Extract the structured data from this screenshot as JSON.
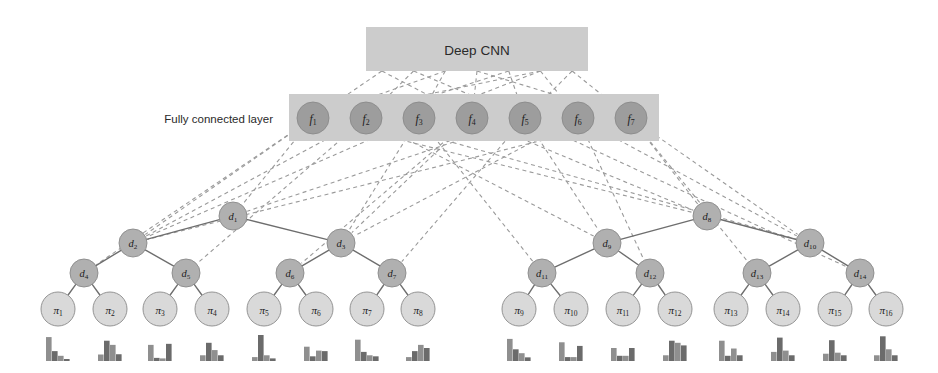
{
  "figure": {
    "type": "diagram",
    "title_box": {
      "label": "Deep CNN"
    },
    "side_label": {
      "label": "Fully connected layer"
    },
    "colors": {
      "box_fill": "#cccccc",
      "fc_node_fill": "#9d9d9d",
      "decision_node_fill": "#b0b0b0",
      "leaf_node_fill": "#d9d9d9",
      "node_stroke": "#8a8a8a",
      "solid_edge": "#6e6e6e",
      "dashed_edge": "#9a9a9a",
      "hist_bar": "#8f8f8f",
      "hist_bar_dark": "#6b6b6b",
      "text": "#1c1c1c",
      "background": "#ffffff"
    },
    "cnn_box": {
      "x": 366,
      "y": 27,
      "w": 222,
      "h": 44
    },
    "fc_box": {
      "x": 289,
      "y": 94,
      "w": 370,
      "h": 47
    },
    "fc_nodes": [
      {
        "id": "f1",
        "base": "f",
        "sub": "1",
        "cx": 313,
        "cy": 118,
        "r": 16
      },
      {
        "id": "f2",
        "base": "f",
        "sub": "2",
        "cx": 366,
        "cy": 118,
        "r": 16
      },
      {
        "id": "f3",
        "base": "f",
        "sub": "3",
        "cx": 419,
        "cy": 118,
        "r": 16
      },
      {
        "id": "f4",
        "base": "f",
        "sub": "4",
        "cx": 472,
        "cy": 118,
        "r": 16
      },
      {
        "id": "f5",
        "base": "f",
        "sub": "5",
        "cx": 525,
        "cy": 118,
        "r": 16
      },
      {
        "id": "f6",
        "base": "f",
        "sub": "6",
        "cx": 578,
        "cy": 118,
        "r": 16
      },
      {
        "id": "f7",
        "base": "f",
        "sub": "7",
        "cx": 631,
        "cy": 118,
        "r": 16
      }
    ],
    "decision_nodes": [
      {
        "id": "d1",
        "base": "d",
        "sub": "1",
        "cx": 233,
        "cy": 216,
        "r": 14
      },
      {
        "id": "d2",
        "base": "d",
        "sub": "2",
        "cx": 133,
        "cy": 243,
        "r": 14
      },
      {
        "id": "d3",
        "base": "d",
        "sub": "3",
        "cx": 341,
        "cy": 243,
        "r": 14
      },
      {
        "id": "d4",
        "base": "d",
        "sub": "4",
        "cx": 84,
        "cy": 273,
        "r": 14
      },
      {
        "id": "d5",
        "base": "d",
        "sub": "5",
        "cx": 186,
        "cy": 273,
        "r": 14
      },
      {
        "id": "d6",
        "base": "d",
        "sub": "6",
        "cx": 290,
        "cy": 273,
        "r": 14
      },
      {
        "id": "d7",
        "base": "d",
        "sub": "7",
        "cx": 392,
        "cy": 273,
        "r": 14
      },
      {
        "id": "d8",
        "base": "d",
        "sub": "8",
        "cx": 707,
        "cy": 216,
        "r": 14
      },
      {
        "id": "d9",
        "base": "d",
        "sub": "9",
        "cx": 607,
        "cy": 243,
        "r": 14
      },
      {
        "id": "d10",
        "base": "d",
        "sub": "10",
        "cx": 810,
        "cy": 243,
        "r": 14
      },
      {
        "id": "d11",
        "base": "d",
        "sub": "11",
        "cx": 542,
        "cy": 273,
        "r": 14
      },
      {
        "id": "d12",
        "base": "d",
        "sub": "12",
        "cx": 650,
        "cy": 273,
        "r": 14
      },
      {
        "id": "d13",
        "base": "d",
        "sub": "13",
        "cx": 757,
        "cy": 273,
        "r": 14
      },
      {
        "id": "d14",
        "base": "d",
        "sub": "14",
        "cx": 860,
        "cy": 273,
        "r": 14
      }
    ],
    "leaf_nodes": [
      {
        "id": "pi1",
        "base": "π",
        "sub": "1",
        "cx": 58,
        "cy": 309,
        "r": 17
      },
      {
        "id": "pi2",
        "base": "π",
        "sub": "2",
        "cx": 110,
        "cy": 309,
        "r": 17
      },
      {
        "id": "pi3",
        "base": "π",
        "sub": "3",
        "cx": 160,
        "cy": 309,
        "r": 17
      },
      {
        "id": "pi4",
        "base": "π",
        "sub": "4",
        "cx": 212,
        "cy": 309,
        "r": 17
      },
      {
        "id": "pi5",
        "base": "π",
        "sub": "5",
        "cx": 264,
        "cy": 309,
        "r": 17
      },
      {
        "id": "pi6",
        "base": "π",
        "sub": "6",
        "cx": 316,
        "cy": 309,
        "r": 17
      },
      {
        "id": "pi7",
        "base": "π",
        "sub": "7",
        "cx": 367,
        "cy": 309,
        "r": 17
      },
      {
        "id": "pi8",
        "base": "π",
        "sub": "8",
        "cx": 418,
        "cy": 309,
        "r": 17
      },
      {
        "id": "pi9",
        "base": "π",
        "sub": "9",
        "cx": 519,
        "cy": 309,
        "r": 17
      },
      {
        "id": "pi10",
        "base": "π",
        "sub": "10",
        "cx": 571,
        "cy": 309,
        "r": 17
      },
      {
        "id": "pi11",
        "base": "π",
        "sub": "11",
        "cx": 623,
        "cy": 309,
        "r": 17
      },
      {
        "id": "pi12",
        "base": "π",
        "sub": "12",
        "cx": 675,
        "cy": 309,
        "r": 17
      },
      {
        "id": "pi13",
        "base": "π",
        "sub": "13",
        "cx": 731,
        "cy": 309,
        "r": 17
      },
      {
        "id": "pi14",
        "base": "π",
        "sub": "14",
        "cx": 783,
        "cy": 309,
        "r": 17
      },
      {
        "id": "pi15",
        "base": "π",
        "sub": "15",
        "cx": 835,
        "cy": 309,
        "r": 17
      },
      {
        "id": "pi16",
        "base": "π",
        "sub": "16",
        "cx": 886,
        "cy": 309,
        "r": 17
      }
    ],
    "tree_edges": [
      [
        "d1",
        "d2"
      ],
      [
        "d1",
        "d3"
      ],
      [
        "d2",
        "d4"
      ],
      [
        "d2",
        "d5"
      ],
      [
        "d3",
        "d6"
      ],
      [
        "d3",
        "d7"
      ],
      [
        "d4",
        "pi1"
      ],
      [
        "d4",
        "pi2"
      ],
      [
        "d5",
        "pi3"
      ],
      [
        "d5",
        "pi4"
      ],
      [
        "d6",
        "pi5"
      ],
      [
        "d6",
        "pi6"
      ],
      [
        "d7",
        "pi7"
      ],
      [
        "d7",
        "pi8"
      ],
      [
        "d8",
        "d9"
      ],
      [
        "d8",
        "d10"
      ],
      [
        "d9",
        "d11"
      ],
      [
        "d9",
        "d12"
      ],
      [
        "d10",
        "d13"
      ],
      [
        "d10",
        "d14"
      ],
      [
        "d11",
        "pi9"
      ],
      [
        "d11",
        "pi10"
      ],
      [
        "d12",
        "pi11"
      ],
      [
        "d12",
        "pi12"
      ],
      [
        "d13",
        "pi13"
      ],
      [
        "d13",
        "pi14"
      ],
      [
        "d14",
        "pi15"
      ],
      [
        "d14",
        "pi16"
      ]
    ],
    "cnn_to_fc_edges": [
      [
        "cnn_b1",
        "f1"
      ],
      [
        "cnn_b2",
        "f2"
      ],
      [
        "cnn_b3",
        "f3"
      ],
      [
        "cnn_b4",
        "f4"
      ],
      [
        "cnn_b5",
        "f5"
      ],
      [
        "cnn_b6",
        "f6"
      ],
      [
        "cnn_b7",
        "f7"
      ],
      [
        "cnn_b2",
        "f5"
      ],
      [
        "cnn_b3",
        "f1"
      ],
      [
        "cnn_b5",
        "f2"
      ],
      [
        "cnn_b6",
        "f3"
      ],
      [
        "cnn_b1",
        "f4"
      ],
      [
        "cnn_b7",
        "f5"
      ],
      [
        "cnn_b4",
        "f7"
      ],
      [
        "cnn_b6",
        "f1"
      ]
    ],
    "fc_to_tree_edges": [
      [
        "f1",
        "d2"
      ],
      [
        "f1",
        "d4"
      ],
      [
        "f1",
        "d1"
      ],
      [
        "f2",
        "d2"
      ],
      [
        "f2",
        "d5"
      ],
      [
        "f2",
        "d9"
      ],
      [
        "f3",
        "d2"
      ],
      [
        "f3",
        "d3"
      ],
      [
        "f3",
        "d11"
      ],
      [
        "f4",
        "d3"
      ],
      [
        "f4",
        "d6"
      ],
      [
        "f4",
        "d8"
      ],
      [
        "f5",
        "d1"
      ],
      [
        "f5",
        "d7"
      ],
      [
        "f5",
        "d9"
      ],
      [
        "f6",
        "d3"
      ],
      [
        "f6",
        "d10"
      ],
      [
        "f6",
        "d12"
      ],
      [
        "f7",
        "d8"
      ],
      [
        "f7",
        "d10"
      ],
      [
        "f7",
        "d13"
      ],
      [
        "f1",
        "d8"
      ],
      [
        "f2",
        "d10"
      ],
      [
        "f7",
        "d2"
      ],
      [
        "f5",
        "d14"
      ]
    ],
    "histograms": {
      "y_base": 361,
      "max_height": 26,
      "bar_width": 6,
      "bins": 4,
      "series": [
        {
          "leaf": "pi1",
          "cx": 58,
          "values": [
            0.92,
            0.38,
            0.2,
            0.07
          ]
        },
        {
          "leaf": "pi2",
          "cx": 110,
          "values": [
            0.25,
            0.78,
            0.62,
            0.26
          ]
        },
        {
          "leaf": "pi3",
          "cx": 160,
          "values": [
            0.62,
            0.12,
            0.1,
            0.66
          ]
        },
        {
          "leaf": "pi4",
          "cx": 212,
          "values": [
            0.22,
            0.7,
            0.42,
            0.22
          ]
        },
        {
          "leaf": "pi5",
          "cx": 264,
          "values": [
            0.15,
            1.0,
            0.22,
            0.1
          ]
        },
        {
          "leaf": "pi6",
          "cx": 316,
          "values": [
            0.55,
            0.18,
            0.4,
            0.38
          ]
        },
        {
          "leaf": "pi7",
          "cx": 367,
          "values": [
            0.82,
            0.35,
            0.22,
            0.18
          ]
        },
        {
          "leaf": "pi8",
          "cx": 418,
          "values": [
            0.15,
            0.38,
            0.62,
            0.5
          ]
        },
        {
          "leaf": "pi9",
          "cx": 519,
          "values": [
            0.85,
            0.45,
            0.3,
            0.14
          ]
        },
        {
          "leaf": "pi10",
          "cx": 571,
          "values": [
            0.72,
            0.15,
            0.15,
            0.58
          ]
        },
        {
          "leaf": "pi11",
          "cx": 623,
          "values": [
            0.5,
            0.2,
            0.2,
            0.5
          ]
        },
        {
          "leaf": "pi12",
          "cx": 675,
          "values": [
            0.22,
            0.78,
            0.7,
            0.6
          ]
        },
        {
          "leaf": "pi13",
          "cx": 731,
          "values": [
            0.78,
            0.2,
            0.48,
            0.22
          ]
        },
        {
          "leaf": "pi14",
          "cx": 783,
          "values": [
            0.35,
            0.9,
            0.4,
            0.22
          ]
        },
        {
          "leaf": "pi15",
          "cx": 835,
          "values": [
            0.28,
            0.8,
            0.32,
            0.22
          ]
        },
        {
          "leaf": "pi16",
          "cx": 886,
          "values": [
            0.22,
            0.95,
            0.45,
            0.22
          ]
        }
      ]
    }
  },
  "chart_data": {
    "type": "bar",
    "xlabel": "",
    "ylabel": "",
    "categories": [
      "bin 1",
      "bin 2",
      "bin 3",
      "bin 4"
    ],
    "ylim": [
      0,
      1
    ],
    "grid": false,
    "legend": "none",
    "series": [
      {
        "name": "π₁",
        "values": [
          0.92,
          0.38,
          0.2,
          0.07
        ]
      },
      {
        "name": "π₂",
        "values": [
          0.25,
          0.78,
          0.62,
          0.26
        ]
      },
      {
        "name": "π₃",
        "values": [
          0.62,
          0.12,
          0.1,
          0.66
        ]
      },
      {
        "name": "π₄",
        "values": [
          0.22,
          0.7,
          0.42,
          0.22
        ]
      },
      {
        "name": "π₅",
        "values": [
          0.15,
          1.0,
          0.22,
          0.1
        ]
      },
      {
        "name": "π₆",
        "values": [
          0.55,
          0.18,
          0.4,
          0.38
        ]
      },
      {
        "name": "π₇",
        "values": [
          0.82,
          0.35,
          0.22,
          0.18
        ]
      },
      {
        "name": "π₈",
        "values": [
          0.15,
          0.38,
          0.62,
          0.5
        ]
      },
      {
        "name": "π₉",
        "values": [
          0.85,
          0.45,
          0.3,
          0.14
        ]
      },
      {
        "name": "π₁₀",
        "values": [
          0.72,
          0.15,
          0.15,
          0.58
        ]
      },
      {
        "name": "π₁₁",
        "values": [
          0.5,
          0.2,
          0.2,
          0.5
        ]
      },
      {
        "name": "π₁₂",
        "values": [
          0.22,
          0.78,
          0.7,
          0.6
        ]
      },
      {
        "name": "π₁₃",
        "values": [
          0.78,
          0.2,
          0.48,
          0.22
        ]
      },
      {
        "name": "π₁₄",
        "values": [
          0.35,
          0.9,
          0.4,
          0.22
        ]
      },
      {
        "name": "π₁₅",
        "values": [
          0.28,
          0.8,
          0.32,
          0.22
        ]
      },
      {
        "name": "π₁₆",
        "values": [
          0.22,
          0.95,
          0.45,
          0.22
        ]
      }
    ]
  }
}
